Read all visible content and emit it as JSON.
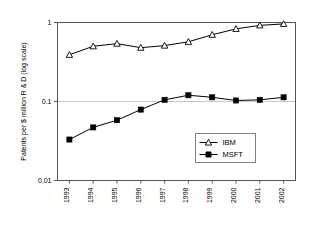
{
  "chart_data": {
    "type": "line",
    "title": "",
    "subtitle": "",
    "xlabel": "",
    "ylabel": "Patents per $ million R & D (log scale)",
    "categories": [
      "1993",
      "1994",
      "1995",
      "1996",
      "1997",
      "1998",
      "1999",
      "2000",
      "2001",
      "2002"
    ],
    "series": [
      {
        "name": "IBM",
        "marker": "open-triangle",
        "color": "#000000",
        "values": [
          0.39,
          0.5,
          0.54,
          0.48,
          0.51,
          0.57,
          0.7,
          0.83,
          0.92,
          0.96
        ]
      },
      {
        "name": "MSFT",
        "marker": "filled-square",
        "color": "#000000",
        "values": [
          0.033,
          0.047,
          0.058,
          0.079,
          0.105,
          0.12,
          0.113,
          0.103,
          0.105,
          0.113
        ]
      }
    ],
    "yscale": "log",
    "ylim": [
      0.01,
      1
    ],
    "ytick_labels": [
      "1",
      "0.1",
      "0.01"
    ],
    "ytick_values": [
      1,
      0.1,
      0.01
    ],
    "xtick_labels": [
      "1993",
      "1994",
      "1995",
      "1996",
      "1997",
      "1998",
      "1999",
      "2000",
      "2001",
      "2002"
    ],
    "grid": true,
    "gridlines_at": [
      0.1
    ],
    "legend_position": "inside-lower-right",
    "legend_entries": [
      {
        "label": "IBM",
        "marker": "open-triangle"
      },
      {
        "label": "MSFT",
        "marker": "filled-square"
      }
    ]
  },
  "colors": {
    "plot_border": "#555555",
    "gridline": "#c8c8c8",
    "series_line": "#000000",
    "marker_fill_open": "#ffffff",
    "marker_fill_solid": "#000000",
    "legend_border": "#808080",
    "background": "#ffffff",
    "text": "#000000"
  }
}
